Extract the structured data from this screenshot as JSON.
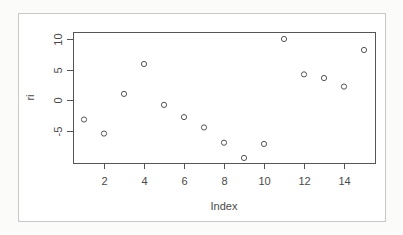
{
  "chart_data": {
    "type": "scatter",
    "title": "",
    "xlabel": "Index",
    "ylabel": "ri",
    "x": [
      1,
      2,
      3,
      4,
      5,
      6,
      7,
      8,
      9,
      10,
      11,
      12,
      13,
      14,
      15
    ],
    "values": [
      -3.2,
      -5.5,
      1.0,
      5.9,
      -0.8,
      -2.8,
      -4.5,
      -7.0,
      -9.5,
      -7.2,
      10.0,
      4.2,
      3.6,
      2.2,
      8.2
    ],
    "xlim": [
      0.44,
      15.56
    ],
    "ylim": [
      -10.3,
      11.1
    ],
    "x_ticks": [
      2,
      4,
      6,
      8,
      10,
      12,
      14
    ],
    "y_ticks": [
      -5,
      0,
      5,
      10
    ],
    "x_tick_labels": [
      "2",
      "4",
      "6",
      "8",
      "10",
      "12",
      "14"
    ],
    "y_tick_labels": [
      "-5",
      "0",
      "5",
      "10"
    ],
    "marker": "open-circle",
    "grid": false,
    "legend": null,
    "colors": {
      "points": "#555555",
      "axis": "#555555",
      "text": "#4a4a4a",
      "background": "#ffffff",
      "outer_border": "#c8c8c8"
    }
  },
  "layout": {
    "plot_left": 73,
    "plot_right": 375,
    "plot_top": 32,
    "plot_bottom": 163,
    "x_origin_px": 84,
    "x_px_per_unit": 20,
    "y_zero_px": 100,
    "y_px_per_unit": 6.1
  }
}
